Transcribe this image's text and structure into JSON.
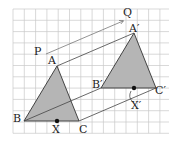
{
  "diagram": {
    "type": "geometric-translation",
    "grid": {
      "x0": 13,
      "y0": 9,
      "cols": 14,
      "rows": 11,
      "step": 11.3,
      "color": "#c9c9c9"
    },
    "colors": {
      "fill": "#b5b5b5",
      "stroke": "#333333",
      "vector": "#555555"
    },
    "labels": {
      "P": "P",
      "Q": "Q",
      "A": "A",
      "B": "B",
      "C": "C",
      "X": "X",
      "A_prime": "A′",
      "B_prime": "B′",
      "C_prime": "C′",
      "X_prime": "X′"
    },
    "points": {
      "P": [
        46,
        54
      ],
      "Q": [
        123,
        21
      ],
      "A": [
        57,
        66
      ],
      "B": [
        24,
        121
      ],
      "C": [
        79,
        121
      ],
      "X": [
        57,
        121
      ],
      "A_prime": [
        134,
        33
      ],
      "B_prime": [
        101,
        88
      ],
      "C_prime": [
        156,
        88
      ],
      "X_prime": [
        134,
        88
      ]
    }
  }
}
